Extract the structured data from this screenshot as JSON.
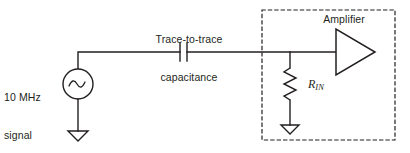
{
  "diagram": {
    "background_color": "#ffffff",
    "line_color": "#231f20",
    "text_color": "#231f20"
  },
  "labels": {
    "source": "10 MHz\nsignal\nsource",
    "source_line1": "10 MHz",
    "source_line2": "signal",
    "source_line3": "source",
    "capacitance_line1": "Trace-to-trace",
    "capacitance_line2": "capacitance",
    "amplifier": "Amplifier",
    "resistor_symbol": "R",
    "resistor_subscript": "IN"
  },
  "components": {
    "signal_source": {
      "type": "ac-voltage-source",
      "glyph": "sine-wave",
      "center_x": 78,
      "center_y": 84,
      "radius": 15
    },
    "capacitor": {
      "type": "capacitor",
      "plate_x_left": 180,
      "plate_x_right": 187,
      "center_y": 52
    },
    "resistor": {
      "type": "resistor",
      "orientation": "vertical",
      "x": 290,
      "top_y": 68,
      "bottom_y": 100
    },
    "amplifier": {
      "type": "amplifier-triangle",
      "direction": "right",
      "left_x": 336,
      "tip_x": 375,
      "center_y": 52
    },
    "ground_source": {
      "type": "ground",
      "x": 78,
      "y": 131
    },
    "ground_rin": {
      "type": "ground",
      "x": 290,
      "y": 125
    },
    "enclosure": {
      "type": "dashed-boundary",
      "x": 262,
      "y": 10,
      "width": 133,
      "height": 130
    }
  }
}
